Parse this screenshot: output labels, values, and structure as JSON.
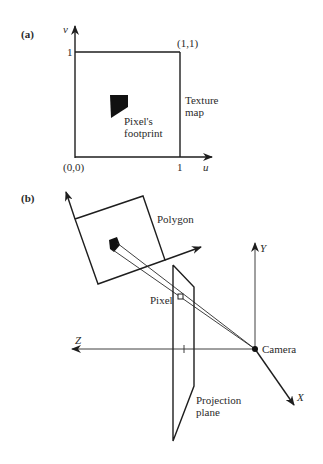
{
  "panel_a": {
    "label": "(a)",
    "axis_v": "v",
    "axis_u": "u",
    "tick_v1": "1",
    "tick_u1": "1",
    "origin": "(0,0)",
    "corner": "(1,1)",
    "texture_line1": "Texture",
    "texture_line2": "map",
    "footprint_line1": "Pixel's",
    "footprint_line2": "footprint"
  },
  "panel_b": {
    "label": "(b)",
    "polygon": "Polygon",
    "pixel": "Pixel",
    "axis_y": "Y",
    "axis_z": "Z",
    "axis_x": "X",
    "camera": "Camera",
    "plane_line1": "Projection",
    "plane_line2": "plane"
  },
  "colors": {
    "ink": "#1e1e1e",
    "background": "#ffffff"
  }
}
